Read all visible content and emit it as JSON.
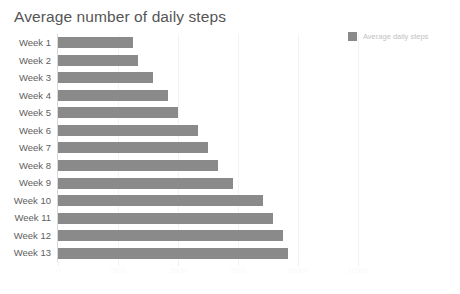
{
  "chart_data": {
    "type": "bar",
    "orientation": "horizontal",
    "title": "Average number of daily steps",
    "xlabel": "",
    "ylabel": "",
    "categories": [
      "Week 1",
      "Week 2",
      "Week 3",
      "Week 4",
      "Week 5",
      "Week 6",
      "Week 7",
      "Week 8",
      "Week 9",
      "Week 10",
      "Week 11",
      "Week 12",
      "Week 13"
    ],
    "values": [
      3125,
      3333,
      3958,
      4583,
      5000,
      5833,
      6250,
      6667,
      7292,
      8542,
      8958,
      9375,
      9583
    ],
    "series": [
      {
        "name": "Average daily steps",
        "values": [
          3125,
          3333,
          3958,
          4583,
          5000,
          5833,
          6250,
          6667,
          7292,
          8542,
          8958,
          9375,
          9583
        ]
      }
    ],
    "xlim": [
      0,
      16250
    ],
    "xticks": [
      0,
      2500,
      5000,
      7500,
      10000,
      12500
    ],
    "xtick_labels": [
      "0",
      "2500",
      "5000",
      "7500",
      "10000",
      "12500"
    ],
    "grid": true,
    "grid_axis": "x",
    "legend": [
      "Average daily steps"
    ],
    "legend_position": "top-right",
    "bar_color": "#8a8a8a"
  },
  "legend": {
    "label": "Average daily steps"
  }
}
